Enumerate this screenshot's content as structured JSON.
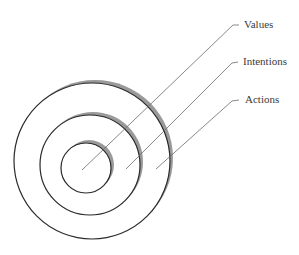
{
  "diagram": {
    "type": "concentric-circles",
    "colors": {
      "background": "#ffffff",
      "stroke": "#2a2a2a",
      "shadow": "#9a9a9a",
      "leader": "#6a6a6a",
      "text": "#3a3a3a"
    },
    "rings": [
      {
        "name": "Actions",
        "cx": 92,
        "cy": 161,
        "r": 78
      },
      {
        "name": "Intentions",
        "cx": 90,
        "cy": 165,
        "r": 50
      },
      {
        "name": "Values",
        "cx": 86,
        "cy": 168,
        "r": 25
      }
    ],
    "labels": [
      {
        "text": "Values",
        "x": 244,
        "y": 28,
        "elbow": [
          233,
          25
        ],
        "tick_end": [
          239,
          25
        ],
        "target": [
          82,
          170
        ]
      },
      {
        "text": "Intentions",
        "x": 243,
        "y": 65,
        "elbow": [
          232,
          63
        ],
        "tick_end": [
          238,
          62
        ],
        "target": [
          126,
          169
        ]
      },
      {
        "text": "Actions",
        "x": 245,
        "y": 103,
        "elbow": [
          232,
          101
        ],
        "tick_end": [
          239,
          100
        ],
        "target": [
          156,
          169
        ]
      }
    ]
  }
}
